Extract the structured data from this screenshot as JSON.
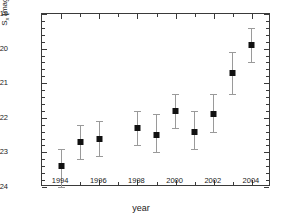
{
  "chart_data": {
    "type": "scatter",
    "title": "",
    "xlabel": "year",
    "ylabel": "S",
    "ylabel_sub": "x",
    "ylabel_units": "[mag/arcsec",
    "ylabel_units_sup": "2",
    "ylabel_units_close": "]",
    "ylabel_full": "S_x [mag/arcsec^2]",
    "xlim": [
      1993.0,
      2005.0
    ],
    "ylim": [
      24,
      19
    ],
    "y_inverted": true,
    "grid": false,
    "legend": null,
    "xticks": [
      1994,
      1996,
      1998,
      2000,
      2002,
      2004
    ],
    "xtick_labels": [
      "1994",
      "1996",
      "1998",
      "2000",
      "2002",
      "2004"
    ],
    "xticks_minor": [
      1993,
      1995,
      1997,
      1999,
      2001,
      2003,
      2005
    ],
    "yticks": [
      19,
      20,
      21,
      22,
      23,
      24
    ],
    "ytick_labels": [
      "19",
      "20",
      "21",
      "22",
      "23",
      "24"
    ],
    "yticks_minor": [
      19.2,
      19.4,
      19.6,
      19.8,
      20.2,
      20.4,
      20.6,
      20.8,
      21.2,
      21.4,
      21.6,
      21.8,
      22.2,
      22.4,
      22.6,
      22.8,
      23.2,
      23.4,
      23.6,
      23.8
    ],
    "marker": "filled-square",
    "marker_color": "#111111",
    "errorbar_color": "#9a9a9a",
    "x": [
      1994,
      1995,
      1996,
      1998,
      1999,
      2000,
      2001,
      2002,
      2003,
      2004
    ],
    "y": [
      23.4,
      22.7,
      22.6,
      22.3,
      22.5,
      21.8,
      22.4,
      21.9,
      20.7,
      19.9
    ],
    "yerr_lower": [
      0.6,
      0.5,
      0.5,
      0.5,
      0.5,
      0.5,
      0.5,
      0.5,
      0.5,
      0.5
    ],
    "yerr_upper": [
      0.5,
      0.5,
      0.5,
      0.5,
      0.6,
      0.5,
      0.6,
      0.6,
      0.6,
      0.5
    ],
    "points": [
      {
        "year": 1994,
        "value": 23.4,
        "err_lo": 0.6,
        "err_hi": 0.5
      },
      {
        "year": 1995,
        "value": 22.7,
        "err_lo": 0.5,
        "err_hi": 0.5
      },
      {
        "year": 1996,
        "value": 22.6,
        "err_lo": 0.5,
        "err_hi": 0.5
      },
      {
        "year": 1998,
        "value": 22.3,
        "err_lo": 0.5,
        "err_hi": 0.5
      },
      {
        "year": 1999,
        "value": 22.5,
        "err_lo": 0.5,
        "err_hi": 0.6
      },
      {
        "year": 2000,
        "value": 21.8,
        "err_lo": 0.5,
        "err_hi": 0.5
      },
      {
        "year": 2001,
        "value": 22.4,
        "err_lo": 0.5,
        "err_hi": 0.6
      },
      {
        "year": 2002,
        "value": 21.9,
        "err_lo": 0.5,
        "err_hi": 0.6
      },
      {
        "year": 2003,
        "value": 20.7,
        "err_lo": 0.6,
        "err_hi": 0.6
      },
      {
        "year": 2004,
        "value": 19.9,
        "err_lo": 0.5,
        "err_hi": 0.5
      }
    ]
  }
}
